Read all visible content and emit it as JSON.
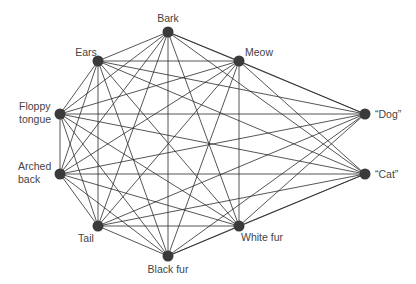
{
  "diagram": {
    "type": "network-graph",
    "node_color": "#3a3a3a",
    "edge_color": "#2b2b2b",
    "nodes": [
      {
        "id": "bark",
        "label": [
          "Bark"
        ],
        "x": 168,
        "y": 32,
        "lx": 168,
        "ly": 22,
        "anchor": "middle"
      },
      {
        "id": "ears",
        "label": [
          "Ears"
        ],
        "x": 98,
        "y": 61,
        "lx": 86,
        "ly": 56,
        "anchor": "middle"
      },
      {
        "id": "meow",
        "label": [
          "Meow"
        ],
        "x": 239,
        "y": 61,
        "lx": 259,
        "ly": 56,
        "anchor": "middle"
      },
      {
        "id": "floppy",
        "label": [
          "Floppy",
          "tongue"
        ],
        "x": 60,
        "y": 114,
        "lx": 19,
        "ly": 116,
        "anchor": "start"
      },
      {
        "id": "arched",
        "label": [
          "Arched",
          "back"
        ],
        "x": 60,
        "y": 174,
        "lx": 18,
        "ly": 176,
        "anchor": "start"
      },
      {
        "id": "tail",
        "label": [
          "Tail"
        ],
        "x": 98,
        "y": 226,
        "lx": 86,
        "ly": 242,
        "anchor": "middle"
      },
      {
        "id": "black",
        "label": [
          "Black fur"
        ],
        "x": 168,
        "y": 256,
        "lx": 168,
        "ly": 273,
        "anchor": "middle"
      },
      {
        "id": "white",
        "label": [
          "White fur"
        ],
        "x": 239,
        "y": 226,
        "lx": 262,
        "ly": 241,
        "anchor": "middle"
      },
      {
        "id": "dog",
        "label": [
          "“Dog”"
        ],
        "x": 365,
        "y": 114,
        "lx": 375,
        "ly": 118,
        "anchor": "start"
      },
      {
        "id": "cat",
        "label": [
          "“Cat”"
        ],
        "x": 365,
        "y": 174,
        "lx": 375,
        "ly": 178,
        "anchor": "start"
      }
    ],
    "edges": [
      [
        "bark",
        "ears"
      ],
      [
        "bark",
        "meow"
      ],
      [
        "bark",
        "floppy"
      ],
      [
        "bark",
        "arched"
      ],
      [
        "bark",
        "tail"
      ],
      [
        "bark",
        "black"
      ],
      [
        "bark",
        "white"
      ],
      [
        "bark",
        "dog"
      ],
      [
        "bark",
        "cat"
      ],
      [
        "ears",
        "meow"
      ],
      [
        "ears",
        "floppy"
      ],
      [
        "ears",
        "arched"
      ],
      [
        "ears",
        "tail"
      ],
      [
        "ears",
        "black"
      ],
      [
        "ears",
        "white"
      ],
      [
        "ears",
        "dog"
      ],
      [
        "ears",
        "cat"
      ],
      [
        "meow",
        "floppy"
      ],
      [
        "meow",
        "arched"
      ],
      [
        "meow",
        "tail"
      ],
      [
        "meow",
        "black"
      ],
      [
        "meow",
        "white"
      ],
      [
        "meow",
        "dog"
      ],
      [
        "meow",
        "cat"
      ],
      [
        "floppy",
        "arched"
      ],
      [
        "floppy",
        "tail"
      ],
      [
        "floppy",
        "black"
      ],
      [
        "floppy",
        "white"
      ],
      [
        "floppy",
        "dog"
      ],
      [
        "floppy",
        "cat"
      ],
      [
        "arched",
        "tail"
      ],
      [
        "arched",
        "black"
      ],
      [
        "arched",
        "white"
      ],
      [
        "arched",
        "dog"
      ],
      [
        "arched",
        "cat"
      ],
      [
        "tail",
        "black"
      ],
      [
        "tail",
        "white"
      ],
      [
        "tail",
        "dog"
      ],
      [
        "tail",
        "cat"
      ],
      [
        "black",
        "white"
      ],
      [
        "black",
        "dog"
      ],
      [
        "black",
        "cat"
      ],
      [
        "white",
        "dog"
      ],
      [
        "white",
        "cat"
      ]
    ]
  }
}
